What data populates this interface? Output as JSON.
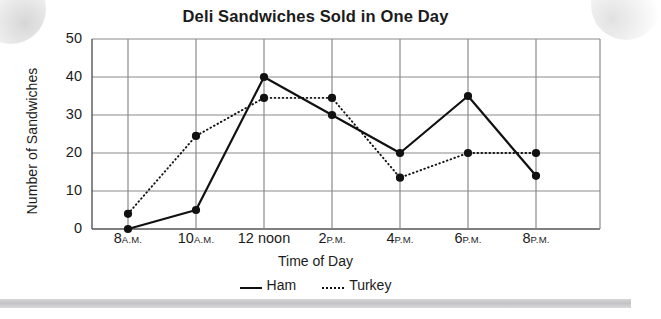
{
  "title": "Deli Sandwiches Sold in One Day",
  "axes": {
    "x_title": "Time of Day",
    "y_title": "Number of Sandwiches"
  },
  "legend": {
    "items": [
      {
        "label": "Ham",
        "style": "solid",
        "color": "#111111"
      },
      {
        "label": "Turkey",
        "style": "dotted",
        "color": "#111111"
      }
    ]
  },
  "y_ticks": [
    "50",
    "40",
    "30",
    "20",
    "10",
    "0"
  ],
  "x_ticks": [
    {
      "num": "8",
      "suffix": "A.M."
    },
    {
      "num": "10",
      "suffix": "A.M."
    },
    {
      "num": "12",
      "suffix": "noon"
    },
    {
      "num": "2",
      "suffix": "P.M."
    },
    {
      "num": "4",
      "suffix": "P.M."
    },
    {
      "num": "6",
      "suffix": "P.M."
    },
    {
      "num": "8",
      "suffix": "P.M."
    }
  ],
  "chart_data": {
    "type": "line",
    "title": "Deli Sandwiches Sold in One Day",
    "xlabel": "Time of Day",
    "ylabel": "Number of Sandwiches",
    "categories": [
      "8 A.M.",
      "10 A.M.",
      "12 noon",
      "2 P.M.",
      "4 P.M.",
      "6 P.M.",
      "8 P.M."
    ],
    "ylim": [
      0,
      50
    ],
    "ytick_step": 10,
    "grid": true,
    "legend_position": "bottom",
    "series": [
      {
        "name": "Ham",
        "style": "solid",
        "color": "#111111",
        "values": [
          0,
          5,
          40,
          30,
          20,
          35,
          14
        ]
      },
      {
        "name": "Turkey",
        "style": "dotted",
        "color": "#111111",
        "values": [
          4,
          24.5,
          34.5,
          34.5,
          13.5,
          20,
          20
        ]
      }
    ]
  }
}
